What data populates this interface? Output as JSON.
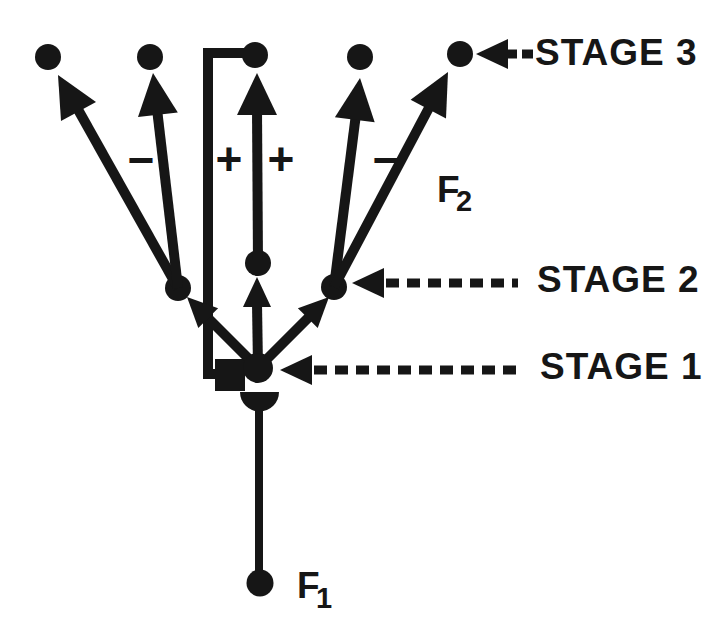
{
  "colors": {
    "ink": "#161616",
    "background": "#ffffff"
  },
  "labels": {
    "stage3": "STAGE 3",
    "stage2": "STAGE 2",
    "stage1": "STAGE 1",
    "f1_base": "F",
    "f1_sub": "1",
    "f2_base": "F",
    "f2_sub": "2",
    "sign_left_minus": "−",
    "sign_plus_left": "+",
    "sign_plus_right": "+",
    "sign_right_minus": "−"
  },
  "diagram": {
    "type": "stage-circuit-diagram",
    "stages": [
      {
        "label": "STAGE 1",
        "node_count": 1
      },
      {
        "label": "STAGE 2",
        "node_count": 3
      },
      {
        "label": "STAGE 3",
        "node_count": 5
      }
    ],
    "edges": [
      {
        "from": "F1 fiber terminal",
        "to": "stage1 node",
        "style": "line with dome terminal",
        "label": "F1"
      },
      {
        "from": "stage1 node",
        "to": "stage2 left node",
        "style": "arrow"
      },
      {
        "from": "stage1 node",
        "to": "stage2 middle node",
        "style": "arrow"
      },
      {
        "from": "stage1 node",
        "to": "stage2 right node",
        "style": "arrow"
      },
      {
        "from": "stage2 left node",
        "to": "stage3 node 1",
        "style": "arrow"
      },
      {
        "from": "stage2 left node",
        "to": "stage3 node 2",
        "style": "arrow",
        "sign": "−"
      },
      {
        "from": "stage2 middle node",
        "to": "stage3 node 3",
        "style": "arrow",
        "sign": "+"
      },
      {
        "from": "stage3 node 3",
        "to": "stage1 node",
        "style": "elbow line with square terminal",
        "sign": "+"
      },
      {
        "from": "stage2 right node",
        "to": "stage3 node 4",
        "style": "arrow",
        "sign": "−"
      },
      {
        "from": "stage2 right node",
        "to": "stage3 node 5",
        "style": "arrow",
        "label": "F2"
      }
    ],
    "pointers": [
      {
        "label": "STAGE 3",
        "points_to": "stage3 node 5",
        "style": "dashed arrow"
      },
      {
        "label": "STAGE 2",
        "points_to": "stage2 right node",
        "style": "dashed arrow"
      },
      {
        "label": "STAGE 1",
        "points_to": "stage1 node",
        "style": "dashed arrow"
      }
    ]
  }
}
